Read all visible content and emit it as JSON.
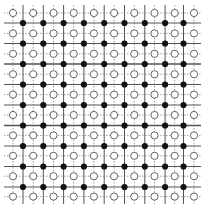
{
  "diagram": {
    "type": "lattice-grid",
    "open_sites": {
      "columns_x": [
        13,
        33.2,
        53.5,
        73.7,
        93.9,
        114.1,
        134.3,
        154.5,
        174.7,
        194
      ],
      "rows_y": [
        13,
        33.4,
        53.8,
        74.2,
        94.6,
        115,
        135.4,
        155.8,
        176.2,
        196.6
      ],
      "style": "hollow",
      "stroke_color": "#666666",
      "fill_color": "#ffffff",
      "radius": 3.6
    },
    "filled_sites": {
      "columns_x": [
        23,
        43.3,
        63.6,
        83.9,
        104.2,
        124.5,
        144.8,
        165.1,
        183.5
      ],
      "rows_y": [
        23,
        43.5,
        64,
        84.5,
        105,
        125.5,
        146,
        166.5,
        187
      ],
      "style": "solid",
      "fill_color": "#111111",
      "radius": 3.1
    },
    "solid_lines_color": "#555555",
    "dotted_lines_color": "#888888",
    "bounds": {
      "x_min": 4,
      "x_max": 201,
      "y_min": 5,
      "y_max": 204
    }
  }
}
